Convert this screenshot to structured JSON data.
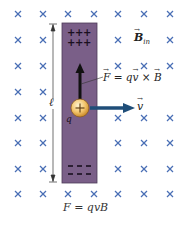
{
  "diagram": {
    "field_marker": "×",
    "field_color": "#4a6fb5",
    "rod_color": "#7a5f88",
    "rod_border": "#4d3a58",
    "arrow_force_color": "#111111",
    "arrow_velocity_color": "#1f4e79",
    "charge_color": "#f3c46a",
    "grid": {
      "cols": [
        18,
        43,
        68,
        94,
        118,
        144,
        170
      ],
      "rows": [
        14,
        40,
        66,
        92,
        118,
        143,
        169,
        194
      ]
    },
    "labels": {
      "field": "B",
      "field_subscript": "in",
      "force_equation": "F = qv × B",
      "force_lhs": "F",
      "force_eq": " = q",
      "force_v": "v",
      "force_cross": " × ",
      "force_B": "B",
      "velocity": "v",
      "charge": "q",
      "charge_sign": "+",
      "length": "ℓ",
      "top_charges": "+ + +",
      "bottom_charges": "– – –",
      "caption": "F = qvB"
    }
  }
}
